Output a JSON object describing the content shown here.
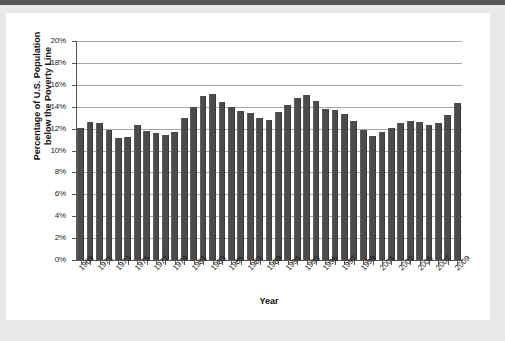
{
  "figure": {
    "background_color": "#ffffff",
    "page_background_color": "#e9e9e9",
    "top_strip_color": "#575757"
  },
  "chart_data": {
    "type": "bar",
    "title": "",
    "subtitle": "",
    "xlabel": "Year",
    "ylabel": "Percentage of U.S. Population below the Poverty Line",
    "ylabel_line1": "Percentage of U.S. Population",
    "ylabel_line2": "below the Poverty Line",
    "ylim": [
      0,
      20
    ],
    "ytick_labels": [
      "0%",
      "2%",
      "4%",
      "6%",
      "8%",
      "10%",
      "12%",
      "14%",
      "16%",
      "18%",
      "20%"
    ],
    "ytick_values": [
      0,
      2,
      4,
      6,
      8,
      10,
      12,
      14,
      16,
      18,
      20
    ],
    "grid": "horizontal",
    "legend": "none",
    "bar_color": "#4b4b4b",
    "gridline_color": "#a6a6a6",
    "axis_color": "#555555",
    "xtick_label_rotation": -45,
    "xtick_label_interval_years": 2,
    "xtick_labels": [
      "1969",
      "1971",
      "1973",
      "1975",
      "1977",
      "1979",
      "1981",
      "1983",
      "1985",
      "1987",
      "1989",
      "1991",
      "1993",
      "1995",
      "1997",
      "1999",
      "2001",
      "2003",
      "2005",
      "2007",
      "2009"
    ],
    "categories": [
      1969,
      1970,
      1971,
      1972,
      1973,
      1974,
      1975,
      1976,
      1977,
      1978,
      1979,
      1980,
      1981,
      1982,
      1983,
      1984,
      1985,
      1986,
      1987,
      1988,
      1989,
      1990,
      1991,
      1992,
      1993,
      1994,
      1995,
      1996,
      1997,
      1998,
      1999,
      2000,
      2001,
      2002,
      2003,
      2004,
      2005,
      2006,
      2007,
      2008,
      2009
    ],
    "values": [
      12.1,
      12.6,
      12.5,
      11.9,
      11.1,
      11.2,
      12.3,
      11.8,
      11.6,
      11.4,
      11.7,
      13.0,
      14.0,
      15.0,
      15.2,
      14.4,
      14.0,
      13.6,
      13.4,
      13.0,
      12.8,
      13.5,
      14.2,
      14.8,
      15.1,
      14.5,
      13.8,
      13.7,
      13.3,
      12.7,
      11.9,
      11.3,
      11.7,
      12.1,
      12.5,
      12.7,
      12.6,
      12.3,
      12.5,
      13.2,
      14.3
    ]
  }
}
